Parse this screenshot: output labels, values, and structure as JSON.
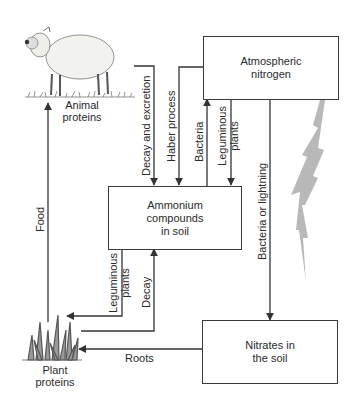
{
  "diagram": {
    "nodes": {
      "atmospheric": {
        "line1": "Atmospheric",
        "line2": "nitrogen"
      },
      "ammonium": {
        "line1": "Ammonium",
        "line2": "compounds",
        "line3": "in soil"
      },
      "nitrates": {
        "line1": "Nitrates in",
        "line2": "the soil"
      },
      "animal": {
        "line1": "Animal",
        "line2": "proteins"
      },
      "plant": {
        "line1": "Plant",
        "line2": "proteins"
      }
    },
    "edges": {
      "food": "Food",
      "decay_excretion": "Decay and excretion",
      "haber": "Haber process",
      "bacteria_up": "Bacteria",
      "leguminous_down_line1": "Leguminous",
      "leguminous_down_line2": "plants",
      "bacteria_lightning": "Bacteria or lightning",
      "leguminous_left_line1": "Leguminous",
      "leguminous_left_line2": "plants",
      "decay": "Decay",
      "roots": "Roots"
    },
    "colors": {
      "line": "#333333",
      "lightning": "#b8b8b8",
      "text": "#2a2a2a"
    }
  }
}
